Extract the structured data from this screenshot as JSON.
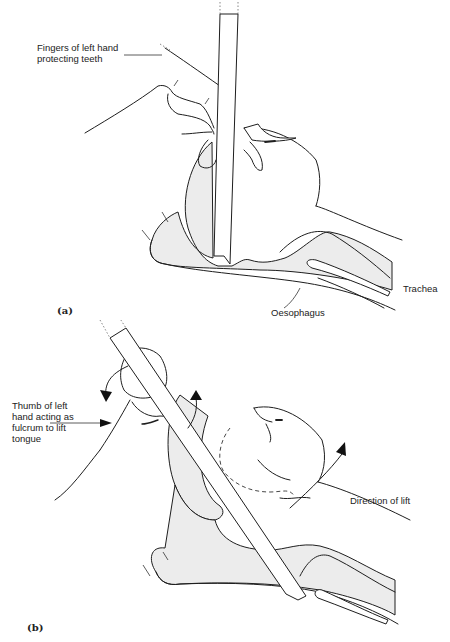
{
  "figure_a": {
    "panel_label": "(a)",
    "labels": {
      "fingers": [
        "Fingers of left hand",
        "protecting teeth"
      ],
      "trachea": "Trachea",
      "oesophagus": "Oesophagus"
    }
  },
  "figure_b": {
    "panel_label": "(b)",
    "labels": {
      "thumb": [
        "Thumb of left",
        "hand acting as",
        "fulcrum to lift",
        "tongue"
      ],
      "direction": "Direction of lift"
    }
  },
  "colors": {
    "line": "#1e1e1e",
    "tissue_fill": "#ececec",
    "background": "#ffffff"
  }
}
